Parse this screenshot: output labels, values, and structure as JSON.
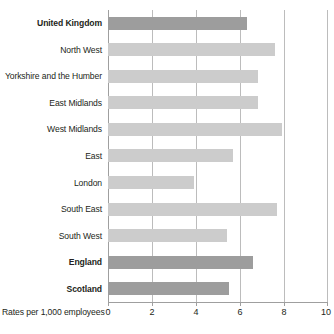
{
  "chart_data": {
    "type": "bar",
    "orientation": "horizontal",
    "title": "",
    "xlabel": "Rates per 1,000 employees",
    "ylabel": "",
    "xlim": [
      0,
      10
    ],
    "xticks": [
      0,
      2,
      4,
      6,
      8,
      10
    ],
    "xtick_labels": [
      "0",
      "2",
      "4",
      "6",
      "8",
      "10"
    ],
    "grid": true,
    "legend": false,
    "categories": [
      "United Kingdom",
      "North West",
      "Yorkshire and the Humber",
      "East Midlands",
      "West Midlands",
      "East",
      "London",
      "South East",
      "South West",
      "England",
      "Scotland"
    ],
    "values": [
      6.3,
      7.6,
      6.8,
      6.8,
      7.9,
      5.7,
      3.9,
      7.7,
      5.4,
      6.6,
      5.5
    ],
    "bars": [
      {
        "label": "United Kingdom",
        "value": 6.3,
        "emphasis": "dark",
        "bold": true
      },
      {
        "label": "North West",
        "value": 7.6,
        "emphasis": "light",
        "bold": false
      },
      {
        "label": "Yorkshire and the Humber",
        "value": 6.8,
        "emphasis": "light",
        "bold": false
      },
      {
        "label": "East Midlands",
        "value": 6.8,
        "emphasis": "light",
        "bold": false
      },
      {
        "label": "West Midlands",
        "value": 7.9,
        "emphasis": "light",
        "bold": false
      },
      {
        "label": "East",
        "value": 5.7,
        "emphasis": "light",
        "bold": false
      },
      {
        "label": "London",
        "value": 3.9,
        "emphasis": "light",
        "bold": false
      },
      {
        "label": "South East",
        "value": 7.7,
        "emphasis": "light",
        "bold": false
      },
      {
        "label": "South West",
        "value": 5.4,
        "emphasis": "light",
        "bold": false
      },
      {
        "label": "England",
        "value": 6.6,
        "emphasis": "dark",
        "bold": true
      },
      {
        "label": "Scotland",
        "value": 5.5,
        "emphasis": "dark",
        "bold": true
      }
    ],
    "colors": {
      "bar_dark": "#9d9d9d",
      "bar_light": "#cccccc",
      "gridline": "#bcbcbc",
      "axis": "#9f9f9f",
      "text": "#231f20",
      "background": "#ffffff"
    }
  }
}
